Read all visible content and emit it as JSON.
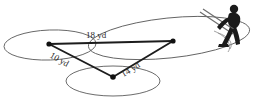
{
  "figure": {
    "kind": "triangle-on-ellipses-diagram",
    "caption_clipped": "",
    "units": "yd",
    "colors": {
      "background": "#ffffff",
      "ellipse_stroke": "#5a5a5a",
      "triangle_stroke": "#1c1c1c",
      "vertex": "#111111",
      "label_text": "#2a2a2a",
      "figure_silhouette": "#1b1b1b"
    },
    "triangle": {
      "vertices": [
        {
          "id": "left-vertex",
          "x": 49,
          "y": 44
        },
        {
          "id": "right-vertex",
          "x": 173,
          "y": 41
        },
        {
          "id": "bottom-vertex",
          "x": 113,
          "y": 77
        }
      ],
      "sides": [
        {
          "id": "side-top",
          "label": "18 yd",
          "value": 18,
          "from": "left-vertex",
          "to": "right-vertex",
          "label_x": 96,
          "label_y": 38,
          "rotation": 0
        },
        {
          "id": "side-left",
          "label": "10 yd",
          "value": 10,
          "from": "left-vertex",
          "to": "bottom-vertex",
          "label_x": 58,
          "label_y": 62,
          "rotation": 30
        },
        {
          "id": "side-right",
          "label": "14 yd",
          "value": 14,
          "from": "bottom-vertex",
          "to": "right-vertex",
          "label_x": 132,
          "label_y": 72,
          "rotation": -31
        }
      ]
    },
    "ellipses": [
      {
        "id": "ellipse-left",
        "cx": 50,
        "cy": 45,
        "rx": 46,
        "ry": 15,
        "rotation": -2
      },
      {
        "id": "ellipse-bottom",
        "cx": 113,
        "cy": 81,
        "rx": 47,
        "ry": 15,
        "rotation": 0
      },
      {
        "id": "ellipse-right",
        "cx": 169,
        "cy": 38,
        "rx": 81,
        "ry": 20,
        "rotation": -6
      }
    ],
    "person": {
      "id": "golfer-silhouette",
      "x": 196,
      "y": 2,
      "width": 60,
      "height": 54
    }
  }
}
